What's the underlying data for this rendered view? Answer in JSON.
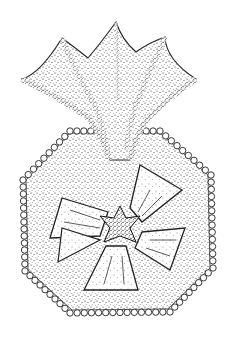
{
  "image": {
    "description": "Stippled ink illustration of a fossil/organism: a four-lobed funnel-shaped cup rising above an octagonal plate with a beaded rim and a five-petalled central rosette",
    "background": "#ffffff",
    "ink": "#1a1a1a",
    "parts": {
      "cup": "funnel-cup-with-pointed-lobes",
      "plate": "octagonal-plate",
      "rim": "beaded-border",
      "center": "five-petal-rosette"
    }
  }
}
